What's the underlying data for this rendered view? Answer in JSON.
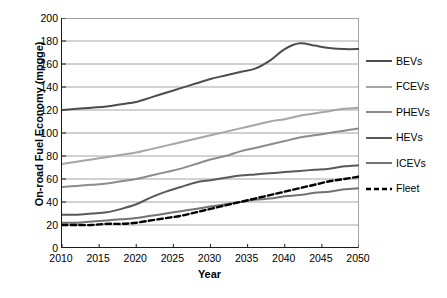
{
  "chart_data": {
    "type": "line",
    "title": "",
    "xlabel": "Year",
    "ylabel": "On-road Fuel Economy (mpgge)",
    "xlim": [
      2010,
      2050
    ],
    "ylim": [
      0,
      200
    ],
    "xticks": [
      "2010",
      "2015",
      "2020",
      "2025",
      "2030",
      "2035",
      "2040",
      "2045",
      "2050"
    ],
    "yticks": [
      "0",
      "20",
      "40",
      "60",
      "80",
      "100",
      "120",
      "140",
      "160",
      "180",
      "200"
    ],
    "grid": "horizontal",
    "legend_position": "right",
    "x": [
      2010,
      2012,
      2014,
      2016,
      2018,
      2020,
      2022,
      2024,
      2026,
      2028,
      2030,
      2032,
      2034,
      2036,
      2038,
      2040,
      2042,
      2044,
      2046,
      2048,
      2050
    ],
    "series": [
      {
        "name": "BEVs",
        "color": "#4d4d4d",
        "width": 2.0,
        "dash": "none",
        "values": [
          120,
          121,
          122,
          123,
          125,
          127,
          131,
          135,
          139,
          143,
          147,
          150,
          153,
          156,
          163,
          173,
          178,
          176,
          174,
          173,
          173
        ]
      },
      {
        "name": "FCEVs",
        "color": "#a6a6a6",
        "width": 2.0,
        "dash": "none",
        "values": [
          73,
          75,
          77,
          79,
          81,
          83,
          86,
          89,
          92,
          95,
          98,
          101,
          104,
          107,
          110,
          112,
          115,
          117,
          119,
          121,
          122
        ]
      },
      {
        "name": "PHEVs",
        "color": "#8c8c8c",
        "width": 2.0,
        "dash": "none",
        "values": [
          53,
          54,
          55,
          56,
          58,
          60,
          63,
          66,
          69,
          73,
          77,
          80,
          84,
          87,
          90,
          93,
          96,
          98,
          100,
          102,
          104
        ]
      },
      {
        "name": "HEVs",
        "color": "#595959",
        "width": 2.0,
        "dash": "none",
        "values": [
          29,
          29,
          30,
          31,
          34,
          38,
          44,
          49,
          53,
          57,
          59,
          61,
          63,
          64,
          65,
          66,
          67,
          68,
          69,
          71,
          72
        ]
      },
      {
        "name": "ICEVs",
        "color": "#737373",
        "width": 2.0,
        "dash": "none",
        "values": [
          22,
          22,
          23,
          24,
          25,
          26,
          28,
          30,
          32,
          34,
          36,
          38,
          40,
          42,
          43,
          45,
          46,
          48,
          49,
          51,
          52
        ]
      },
      {
        "name": "Fleet",
        "color": "#000000",
        "width": 2.4,
        "dash": "dashed",
        "values": [
          20,
          20,
          20,
          21,
          21,
          22,
          24,
          26,
          28,
          31,
          34,
          37,
          40,
          43,
          46,
          49,
          52,
          55,
          58,
          60,
          62
        ]
      }
    ]
  },
  "legend": {
    "items": [
      {
        "label": "BEVs"
      },
      {
        "label": "FCEVs"
      },
      {
        "label": "PHEVs"
      },
      {
        "label": "HEVs"
      },
      {
        "label": "ICEVs"
      },
      {
        "label": "Fleet"
      }
    ]
  },
  "axes": {
    "y_title": "On-road Fuel Economy (mpgge)",
    "x_title": "Year"
  }
}
